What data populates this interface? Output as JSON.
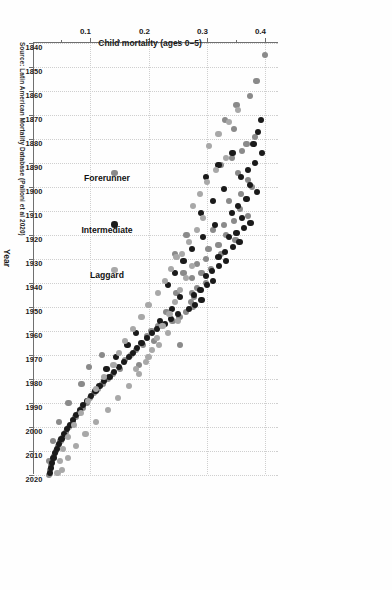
{
  "figure": {
    "caption_label": "FIGURE 3-1",
    "caption_text": "Change in child mortality in Latin American countries, 1840–2020.",
    "source_note": "Source: Latin American Mortality Database (Palloni et al 2020)"
  },
  "chart_data": {
    "type": "scatter",
    "title": "",
    "xlabel": "Year",
    "ylabel": "Child mortality (ages 0–5)",
    "xlim": [
      1840,
      2020
    ],
    "ylim": [
      0.0,
      0.42
    ],
    "grid": true,
    "legend_position": "inside-lower-left",
    "x_ticks": [
      1840,
      1850,
      1860,
      1870,
      1880,
      1890,
      1900,
      1910,
      1920,
      1930,
      1940,
      1950,
      1960,
      1970,
      1980,
      1990,
      2000,
      2010,
      2020
    ],
    "x_tick_labels": [
      "1840",
      "1850",
      "1860",
      "1870",
      "1880",
      "1890",
      "1900",
      "1910",
      "1920",
      "1930",
      "1940",
      "1950",
      "1960",
      "1970",
      "1980",
      "1990",
      "2000",
      "2010",
      "2020"
    ],
    "y_ticks": [
      0.1,
      0.2,
      0.3,
      0.4
    ],
    "y_tick_labels": [
      "0.1",
      "0.2",
      "0.3",
      "0.4"
    ],
    "colors": {
      "forerunner": "#8a8a8a",
      "intermediate": "#1a1a1a",
      "laggard": "#a8a8a8",
      "axis": "#6f6f6f",
      "grid": "#cfcfcf"
    },
    "series": [
      {
        "name": "Forerunner",
        "color": "#8a8a8a",
        "points": [
          [
            1845,
            0.398
          ],
          [
            1856,
            0.383
          ],
          [
            1862,
            0.372
          ],
          [
            1866,
            0.349
          ],
          [
            1872,
            0.329
          ],
          [
            1876,
            0.345
          ],
          [
            1879,
            0.381
          ],
          [
            1882,
            0.366
          ],
          [
            1885,
            0.358
          ],
          [
            1888,
            0.341
          ],
          [
            1891,
            0.322
          ],
          [
            1894,
            0.352
          ],
          [
            1897,
            0.369
          ],
          [
            1900,
            0.375
          ],
          [
            1903,
            0.357
          ],
          [
            1906,
            0.336
          ],
          [
            1909,
            0.355
          ],
          [
            1912,
            0.368
          ],
          [
            1914,
            0.345
          ],
          [
            1916,
            0.327
          ],
          [
            1918,
            0.309
          ],
          [
            1920,
            0.331
          ],
          [
            1922,
            0.347
          ],
          [
            1924,
            0.318
          ],
          [
            1926,
            0.301
          ],
          [
            1928,
            0.322
          ],
          [
            1930,
            0.296
          ],
          [
            1932,
            0.281
          ],
          [
            1934,
            0.305
          ],
          [
            1936,
            0.289
          ],
          [
            1938,
            0.272
          ],
          [
            1940,
            0.296
          ],
          [
            1942,
            0.281
          ],
          [
            1944,
            0.272
          ],
          [
            1946,
            0.276
          ],
          [
            1948,
            0.271
          ],
          [
            1950,
            0.274
          ],
          [
            1952,
            0.262
          ],
          [
            1954,
            0.251
          ],
          [
            1956,
            0.239
          ],
          [
            1958,
            0.215
          ],
          [
            1960,
            0.203
          ],
          [
            1962,
            0.196
          ],
          [
            1964,
            0.208
          ],
          [
            1966,
            0.188
          ],
          [
            1968,
            0.176
          ],
          [
            1970,
            0.168
          ],
          [
            1972,
            0.158
          ],
          [
            1974,
            0.182
          ],
          [
            1976,
            0.149
          ],
          [
            1978,
            0.137
          ],
          [
            1980,
            0.128
          ],
          [
            1982,
            0.119
          ],
          [
            1984,
            0.111
          ],
          [
            1986,
            0.104
          ],
          [
            1988,
            0.098
          ],
          [
            1990,
            0.092
          ],
          [
            1992,
            0.085
          ],
          [
            1994,
            0.079
          ],
          [
            1996,
            0.073
          ],
          [
            1998,
            0.068
          ],
          [
            2000,
            0.062
          ],
          [
            2002,
            0.057
          ],
          [
            2004,
            0.052
          ],
          [
            2006,
            0.047
          ],
          [
            2008,
            0.043
          ],
          [
            2010,
            0.039
          ],
          [
            2012,
            0.036
          ],
          [
            2014,
            0.033
          ],
          [
            2016,
            0.031
          ],
          [
            2018,
            0.029
          ],
          [
            2020,
            0.028
          ],
          [
            1966,
            0.252
          ],
          [
            1970,
            0.118
          ],
          [
            1975,
            0.096
          ],
          [
            1982,
            0.083
          ],
          [
            1990,
            0.061
          ],
          [
            1998,
            0.045
          ],
          [
            2006,
            0.034
          ],
          [
            2014,
            0.027
          ],
          [
            1952,
            0.229
          ],
          [
            1944,
            0.246
          ],
          [
            1936,
            0.258
          ],
          [
            1928,
            0.244
          ],
          [
            1920,
            0.263
          ]
        ]
      },
      {
        "name": "Intermediate",
        "color": "#1a1a1a",
        "points": [
          [
            1872,
            0.391
          ],
          [
            1877,
            0.386
          ],
          [
            1882,
            0.378
          ],
          [
            1886,
            0.392
          ],
          [
            1890,
            0.381
          ],
          [
            1893,
            0.368
          ],
          [
            1896,
            0.356
          ],
          [
            1899,
            0.372
          ],
          [
            1902,
            0.384
          ],
          [
            1905,
            0.366
          ],
          [
            1908,
            0.352
          ],
          [
            1911,
            0.341
          ],
          [
            1913,
            0.358
          ],
          [
            1915,
            0.373
          ],
          [
            1917,
            0.362
          ],
          [
            1919,
            0.349
          ],
          [
            1921,
            0.336
          ],
          [
            1923,
            0.354
          ],
          [
            1925,
            0.343
          ],
          [
            1927,
            0.329
          ],
          [
            1929,
            0.318
          ],
          [
            1931,
            0.331
          ],
          [
            1933,
            0.319
          ],
          [
            1935,
            0.307
          ],
          [
            1937,
            0.296
          ],
          [
            1939,
            0.309
          ],
          [
            1941,
            0.298
          ],
          [
            1943,
            0.287
          ],
          [
            1945,
            0.276
          ],
          [
            1947,
            0.289
          ],
          [
            1949,
            0.278
          ],
          [
            1951,
            0.268
          ],
          [
            1953,
            0.248
          ],
          [
            1955,
            0.236
          ],
          [
            1957,
            0.226
          ],
          [
            1959,
            0.213
          ],
          [
            1961,
            0.204
          ],
          [
            1963,
            0.196
          ],
          [
            1965,
            0.186
          ],
          [
            1967,
            0.178
          ],
          [
            1969,
            0.171
          ],
          [
            1971,
            0.164
          ],
          [
            1973,
            0.156
          ],
          [
            1975,
            0.148
          ],
          [
            1977,
            0.139
          ],
          [
            1979,
            0.131
          ],
          [
            1981,
            0.122
          ],
          [
            1983,
            0.114
          ],
          [
            1985,
            0.107
          ],
          [
            1987,
            0.099
          ],
          [
            1989,
            0.092
          ],
          [
            1991,
            0.086
          ],
          [
            1993,
            0.08
          ],
          [
            1995,
            0.074
          ],
          [
            1997,
            0.068
          ],
          [
            1999,
            0.063
          ],
          [
            2001,
            0.058
          ],
          [
            2003,
            0.053
          ],
          [
            2005,
            0.049
          ],
          [
            2007,
            0.045
          ],
          [
            2009,
            0.041
          ],
          [
            2011,
            0.038
          ],
          [
            2013,
            0.035
          ],
          [
            2015,
            0.033
          ],
          [
            2017,
            0.031
          ],
          [
            2019,
            0.029
          ],
          [
            1886,
            0.342
          ],
          [
            1891,
            0.318
          ],
          [
            1896,
            0.296
          ],
          [
            1901,
            0.328
          ],
          [
            1906,
            0.308
          ],
          [
            1911,
            0.288
          ],
          [
            1916,
            0.312
          ],
          [
            1921,
            0.292
          ],
          [
            1926,
            0.272
          ],
          [
            1931,
            0.258
          ],
          [
            1936,
            0.244
          ],
          [
            1941,
            0.232
          ],
          [
            1946,
            0.252
          ],
          [
            1951,
            0.238
          ],
          [
            1956,
            0.218
          ],
          [
            1961,
            0.176
          ],
          [
            1966,
            0.162
          ],
          [
            1971,
            0.142
          ],
          [
            1976,
            0.126
          ]
        ]
      },
      {
        "name": "Laggard",
        "color": "#a8a8a8",
        "points": [
          [
            1868,
            0.352
          ],
          [
            1873,
            0.336
          ],
          [
            1878,
            0.318
          ],
          [
            1883,
            0.302
          ],
          [
            1888,
            0.331
          ],
          [
            1893,
            0.314
          ],
          [
            1898,
            0.298
          ],
          [
            1903,
            0.286
          ],
          [
            1908,
            0.274
          ],
          [
            1913,
            0.292
          ],
          [
            1918,
            0.281
          ],
          [
            1923,
            0.268
          ],
          [
            1928,
            0.256
          ],
          [
            1933,
            0.272
          ],
          [
            1938,
            0.262
          ],
          [
            1943,
            0.252
          ],
          [
            1948,
            0.244
          ],
          [
            1953,
            0.234
          ],
          [
            1958,
            0.222
          ],
          [
            1963,
            0.212
          ],
          [
            1968,
            0.204
          ],
          [
            1973,
            0.194
          ],
          [
            1978,
            0.182
          ],
          [
            1983,
            0.164
          ],
          [
            1988,
            0.146
          ],
          [
            1993,
            0.128
          ],
          [
            1998,
            0.108
          ],
          [
            2003,
            0.09
          ],
          [
            2008,
            0.074
          ],
          [
            2013,
            0.06
          ],
          [
            2018,
            0.05
          ],
          [
            1954,
            0.186
          ],
          [
            1959,
            0.172
          ],
          [
            1964,
            0.158
          ],
          [
            1969,
            0.148
          ],
          [
            1974,
            0.138
          ],
          [
            1979,
            0.122
          ],
          [
            1984,
            0.108
          ],
          [
            1989,
            0.094
          ],
          [
            1994,
            0.082
          ],
          [
            1999,
            0.07
          ],
          [
            2004,
            0.06
          ],
          [
            2009,
            0.052
          ],
          [
            2014,
            0.046
          ],
          [
            2019,
            0.042
          ],
          [
            1944,
            0.214
          ],
          [
            1949,
            0.198
          ],
          [
            1939,
            0.226
          ],
          [
            1934,
            0.236
          ],
          [
            1929,
            0.246
          ],
          [
            1956,
            0.248
          ],
          [
            1961,
            0.232
          ],
          [
            1966,
            0.216
          ],
          [
            1971,
            0.198
          ],
          [
            1976,
            0.176
          ]
        ]
      }
    ]
  },
  "legend": {
    "items": [
      {
        "label": "Forerunner",
        "color": "#8a8a8a"
      },
      {
        "label": "Intermediate",
        "color": "#1a1a1a"
      },
      {
        "label": "Laggard",
        "color": "#a8a8a8"
      }
    ]
  }
}
